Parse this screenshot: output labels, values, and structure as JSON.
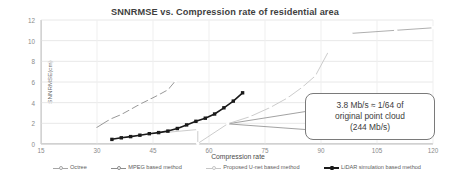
{
  "chart_data": {
    "type": "line",
    "title": "SNNRMSE vs. Compression rate of residential area",
    "xlabel": "Compression rate",
    "ylabel": "SNNRMSE(cm)",
    "xlim": [
      15,
      120
    ],
    "ylim": [
      0,
      12
    ],
    "xticks": [
      15,
      30,
      45,
      60,
      75,
      90,
      105,
      120
    ],
    "yticks": [
      0,
      2,
      4,
      6,
      8,
      10,
      12
    ],
    "grid": "horizontal-and-vertical",
    "legend_position": "bottom",
    "series": [
      {
        "name": "Octree",
        "color": "#a6a6a6",
        "marker": "circle",
        "x": [
          98.0,
          110.0,
          120.0
        ],
        "y": [
          10.7,
          11.0,
          11.25
        ]
      },
      {
        "name": "MPEG based method",
        "color": "#8c8c8c",
        "marker": "circle",
        "x": [
          29.5,
          33.5,
          36.5,
          39.0,
          41.5,
          44.0,
          46.5,
          49.0,
          51.0
        ],
        "y": [
          1.5,
          2.4,
          2.85,
          3.35,
          3.85,
          4.3,
          4.75,
          5.25,
          6.1
        ]
      },
      {
        "name": "Proposed U-net based method",
        "color": "#c6c6c6",
        "marker": "circle",
        "x": [
          48.0,
          57.0,
          57.0,
          65.0,
          71.0,
          76.5,
          81.0,
          85.0,
          88.5,
          92.0
        ],
        "y": [
          1.1,
          1.4,
          0.05,
          1.95,
          2.65,
          3.55,
          4.45,
          5.5,
          6.6,
          8.95
        ]
      },
      {
        "name": "LiDAR simulation based method",
        "color": "#1a1a1a",
        "marker": "square",
        "x": [
          34.0,
          36.5,
          39.0,
          41.5,
          44.0,
          46.5,
          49.0,
          51.5,
          54.0,
          56.5,
          59.0,
          61.5,
          64.0,
          66.5,
          69.0
        ],
        "y": [
          0.45,
          0.6,
          0.72,
          0.85,
          1.0,
          1.1,
          1.25,
          1.5,
          1.85,
          2.2,
          2.5,
          2.9,
          3.5,
          4.15,
          4.95
        ]
      }
    ],
    "annotations": [
      {
        "name": "bitrate-callout",
        "lines": [
          "3.8 Mb/s ≈ 1/64 of",
          "original point cloud",
          "(244 Mb/s)"
        ],
        "leader_target_x": 65,
        "leader_target_y": 1.95
      }
    ]
  },
  "chart": {
    "title": "SNNRMSE vs. Compression rate of residential area",
    "xlabel": "Compression rate",
    "ylabel": "SNNRMSE(cm)"
  },
  "callout": {
    "line1": "3.8 Mb/s ≈ 1/64 of",
    "line2": "original point cloud",
    "line3": "(244 Mb/s)"
  }
}
